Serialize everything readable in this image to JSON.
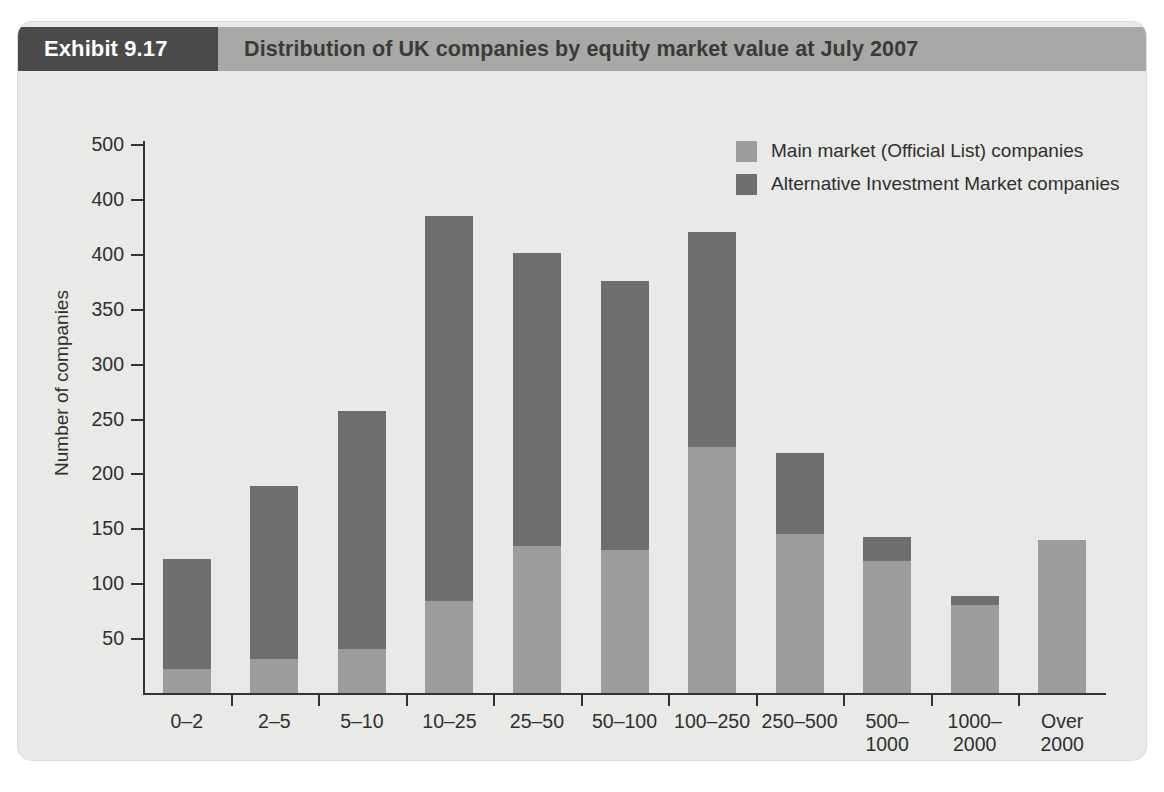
{
  "exhibit": {
    "badge_label": "Exhibit 9.17",
    "title": "Distribution of UK companies by equity market value at July 2007",
    "badge_color": "#4a4a4a",
    "title_bar_color": "#a8a8a6",
    "card_background": "#e9e9e7"
  },
  "chart_data": {
    "type": "bar",
    "stacked": true,
    "title": "Distribution of UK companies by equity market value at July 2007",
    "xlabel": "Market value range (£m)",
    "ylabel": "Number of companies",
    "ylim": [
      0,
      500
    ],
    "yticks": [
      50,
      100,
      150,
      200,
      250,
      300,
      350,
      400,
      450,
      500
    ],
    "ytick_labels": [
      "50",
      "100",
      "150",
      "200",
      "250",
      "300",
      "350",
      "400",
      "400",
      "500"
    ],
    "grid": false,
    "legend_position": "top-right",
    "categories": [
      "0–2",
      "2–5",
      "5–10",
      "10–25",
      "25–50",
      "50–100",
      "100–250",
      "250–500",
      "500–\n1000",
      "1000–\n2000",
      "Over\n2000"
    ],
    "series": [
      {
        "name": "Main market (Official List) companies",
        "color": "#9c9c9c",
        "values": [
          22,
          31,
          40,
          84,
          134,
          130,
          224,
          145,
          120,
          80,
          139
        ]
      },
      {
        "name": "Alternative Investment Market companies",
        "color": "#6e6e6e",
        "values": [
          100,
          158,
          217,
          350,
          267,
          245,
          196,
          74,
          22,
          8,
          0
        ]
      }
    ],
    "totals": [
      122,
      189,
      257,
      434,
      401,
      375,
      420,
      219,
      142,
      88,
      139
    ]
  }
}
